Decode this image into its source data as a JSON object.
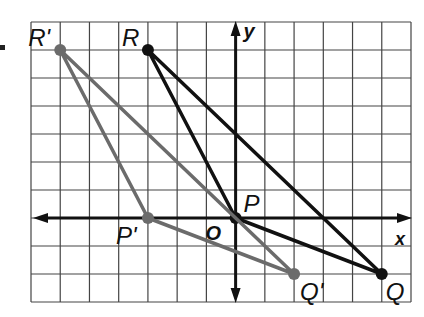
{
  "diagram": {
    "type": "coordinate-plane-transformation",
    "grid": {
      "x_min": -7,
      "x_max": 6,
      "y_min": -3,
      "y_max": 7,
      "unit": 1,
      "line_color": "#444444"
    },
    "axes": {
      "x_label": "x",
      "y_label": "y",
      "origin_label": "O",
      "color": "#111111"
    },
    "triangles": [
      {
        "name": "PQR",
        "color": "#111111",
        "vertices": [
          {
            "id": "P",
            "label": "P",
            "x": 0,
            "y": 0
          },
          {
            "id": "Q",
            "label": "Q",
            "x": 5,
            "y": -2
          },
          {
            "id": "R",
            "label": "R",
            "x": -3,
            "y": 6
          }
        ]
      },
      {
        "name": "P'Q'R'",
        "color": "#6b6b6b",
        "vertices": [
          {
            "id": "P'",
            "label": "P'",
            "x": -3,
            "y": 0
          },
          {
            "id": "Q'",
            "label": "Q'",
            "x": 2,
            "y": -2
          },
          {
            "id": "R'",
            "label": "R'",
            "x": -6,
            "y": 6
          }
        ]
      }
    ]
  }
}
